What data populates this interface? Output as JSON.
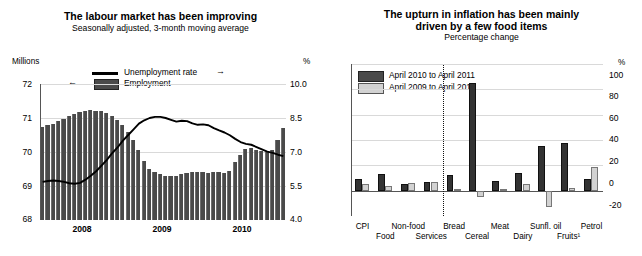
{
  "left": {
    "title": "The labour market has been improving",
    "subtitle": "Seasonally adjusted, 3-month moving average",
    "y_unit": "Millions",
    "y2_unit": "%",
    "legend": [
      {
        "label": "Unemployment rate",
        "marker": "line",
        "arrow": "→"
      },
      {
        "label": "Employment",
        "marker": "bar",
        "arrow": "←"
      }
    ]
  },
  "right": {
    "title_line1": "The upturn in inflation has been mainly",
    "title_line2": "driven by a few food items",
    "subtitle": "Percentage change",
    "y_unit": "%",
    "legend": [
      {
        "label": "April 2010 to April 2011",
        "swatch": "dark"
      },
      {
        "label": "April 2009 to April 2010",
        "swatch": "light"
      }
    ]
  },
  "chart_data": [
    {
      "type": "bar",
      "title": "The labour market has been improving",
      "subtitle": "Seasonally adjusted, 3-month moving average",
      "xlabel": "",
      "ylabel": "Millions",
      "y2label": "%",
      "ylim": [
        68,
        72
      ],
      "y2lim": [
        4.0,
        10.0
      ],
      "yticks": [
        68,
        69,
        70,
        71,
        72
      ],
      "y2ticks": [
        4.0,
        5.5,
        7.0,
        8.5,
        10.0
      ],
      "xticks": [
        2008,
        2009,
        2010
      ],
      "grid": true,
      "legend_position": "top-center",
      "series": [
        {
          "name": "Employment",
          "type": "bar",
          "axis": "left",
          "unit": "Millions",
          "values": [
            70.75,
            70.78,
            70.82,
            70.9,
            70.98,
            71.05,
            71.12,
            71.18,
            71.22,
            71.25,
            71.22,
            71.2,
            71.14,
            71.05,
            70.95,
            70.8,
            70.6,
            70.35,
            70.05,
            69.75,
            69.5,
            69.42,
            69.35,
            69.3,
            69.28,
            69.3,
            69.36,
            69.38,
            69.42,
            69.42,
            69.4,
            69.38,
            69.4,
            69.42,
            69.38,
            69.45,
            69.72,
            69.9,
            70.1,
            70.12,
            70.05,
            70.02,
            70.0,
            70.05,
            70.35,
            70.72
          ]
        },
        {
          "name": "Unemployment rate",
          "type": "line",
          "axis": "right",
          "unit": "%",
          "values": [
            5.68,
            5.72,
            5.74,
            5.72,
            5.68,
            5.62,
            5.6,
            5.64,
            5.78,
            5.95,
            6.15,
            6.4,
            6.65,
            6.95,
            7.2,
            7.5,
            7.75,
            8.0,
            8.25,
            8.4,
            8.5,
            8.55,
            8.55,
            8.5,
            8.42,
            8.34,
            8.38,
            8.36,
            8.26,
            8.2,
            8.22,
            8.18,
            8.05,
            7.95,
            7.86,
            7.74,
            7.58,
            7.44,
            7.36,
            7.32,
            7.22,
            7.12,
            7.02,
            6.96,
            6.88,
            6.82
          ]
        }
      ]
    },
    {
      "type": "bar",
      "title": "The upturn in inflation has been mainly driven by a few food items",
      "subtitle": "Percentage change",
      "xlabel": "",
      "ylabel": "%",
      "ylim": [
        -20,
        100
      ],
      "yticks": [
        -20,
        0,
        20,
        40,
        60,
        80,
        100
      ],
      "grid": true,
      "legend_position": "top-left",
      "separator_after": "Services",
      "categories": [
        "CPI",
        "Food",
        "Non-food",
        "Services",
        "Bread",
        "Cereal",
        "Meat",
        "Dairy",
        "Sunfl. oil",
        "Fruits¹",
        "Petrol"
      ],
      "series": [
        {
          "name": "April 2010 to April 2011",
          "color": "#333333",
          "values": [
            9,
            13,
            5,
            7,
            12,
            85,
            8,
            14,
            35,
            38,
            9
          ]
        },
        {
          "name": "April 2009 to April 2010",
          "color": "#d2d2d2",
          "values": [
            5,
            4,
            6,
            7,
            1,
            -5,
            1,
            5,
            -13,
            2,
            19
          ]
        }
      ]
    }
  ]
}
